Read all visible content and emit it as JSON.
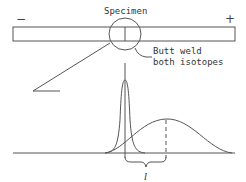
{
  "diagram": {
    "title": "Specimen",
    "polarity": {
      "left": "−",
      "right": "+"
    },
    "annotation": {
      "line1": "Butt  weld",
      "line2": "both  isotopes"
    },
    "distance_label": "l",
    "colors": {
      "stroke": "#555555",
      "text": "#333333",
      "background": "#ffffff"
    },
    "elements": [
      "specimen bar",
      "magnifier circle at weld",
      "butt weld line",
      "narrow concentration peak",
      "broad diffused peak",
      "dashed peak marker",
      "distance bracket"
    ]
  }
}
